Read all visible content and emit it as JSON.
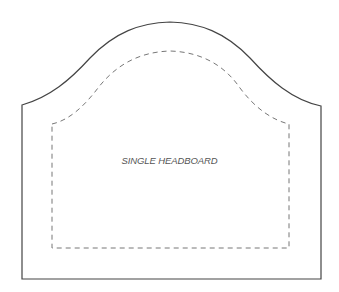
{
  "diagram": {
    "title": "SINGLE HEADBOARD",
    "outline_color": "#444444",
    "seam_color": "#777777",
    "shapes": {
      "outer_outline": "solid headboard cut line",
      "inner_seam": "dashed stitch/padding line"
    }
  }
}
